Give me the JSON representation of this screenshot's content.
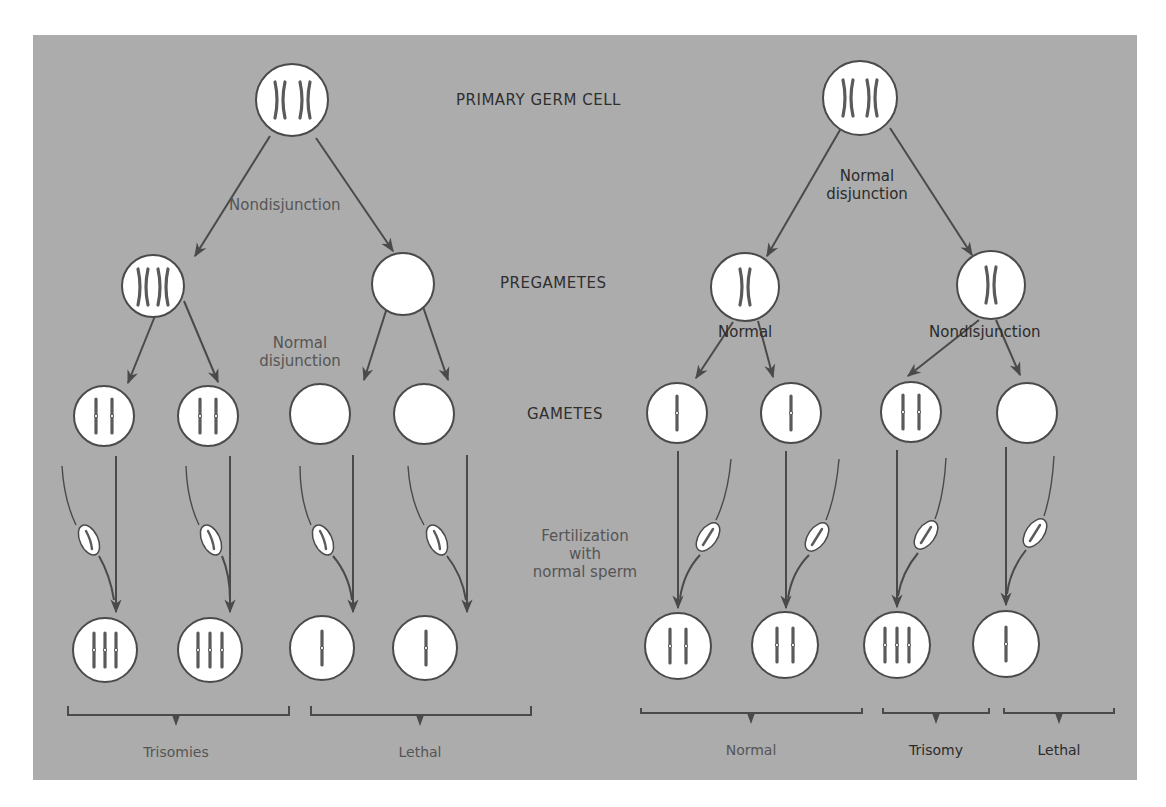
{
  "colors": {
    "panel": "#acacac",
    "cell_fill": "#ffffff",
    "stroke": "#4a4a4a",
    "chromosome": "#5a5a5a",
    "text_dark": "#2f2f2f",
    "text_grey": "#555555"
  },
  "stages": {
    "primary": "PRIMARY GERM CELL",
    "pregametes": "PREGAMETES",
    "gametes": "GAMETES",
    "fertilization": [
      "Fertilization",
      "with",
      "normal sperm"
    ]
  },
  "left_pathway": {
    "first_division": "Nondisjunction",
    "second_division": [
      "Normal",
      "disjunction"
    ],
    "outcomes": [
      "Trisomies",
      "Lethal"
    ]
  },
  "right_pathway": {
    "first_division": [
      "Normal",
      "disjunction"
    ],
    "second_division_left": "Normal",
    "second_division_right": "Nondisjunction",
    "outcomes": [
      "Normal",
      "Trisomy",
      "Lethal"
    ]
  }
}
